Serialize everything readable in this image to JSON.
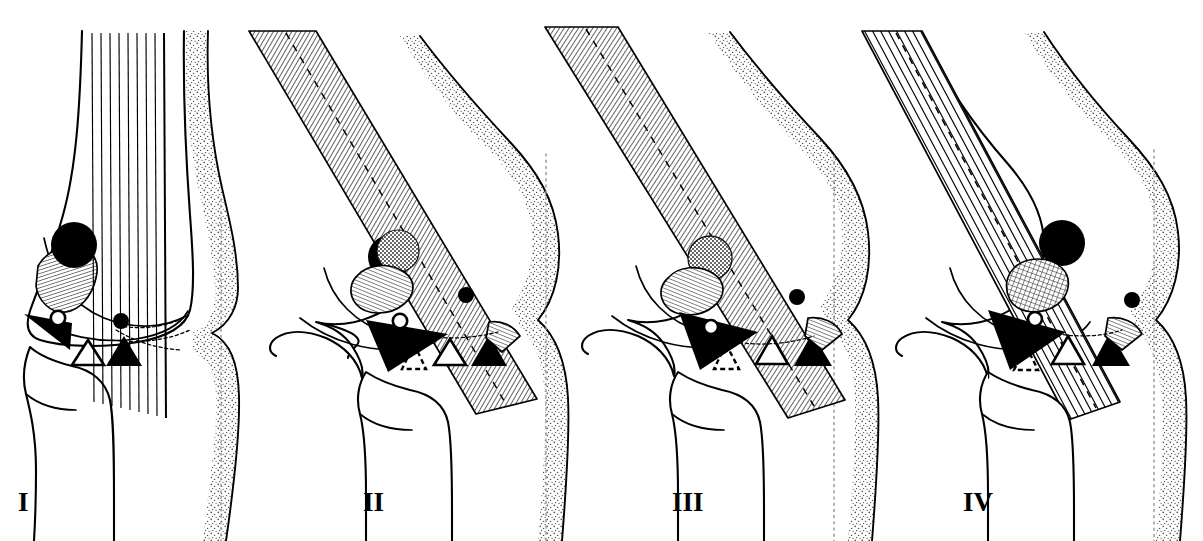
{
  "figure": {
    "background_color": "#ffffff",
    "ink_color": "#000000",
    "reference_line_color": "#9a9a9a",
    "width": 1203,
    "height": 541
  },
  "panels": [
    {
      "id": "panel-1",
      "label": "I",
      "label_x": 18,
      "label_y": 511,
      "state": "full extension",
      "flexion_angle_deg": 0,
      "muscle_band": {
        "style": "parallel-line fascicles, vertical",
        "line_count": 10,
        "angle_deg": 90,
        "has_dashed_axis": false
      },
      "patella_marker": "solid-black-circle",
      "cartilage_marker": "fine-hatch-patch",
      "markers": [
        "solid-left-triangle",
        "open-circle",
        "solid-circle",
        "open-up-triangle",
        "solid-up-triangle"
      ],
      "has_dashed_triangle": false,
      "has_posterior_dot": false,
      "has_tibial-tubercle-hatch": false
    },
    {
      "id": "panel-2",
      "label": "II",
      "label_x": 363,
      "label_y": 511,
      "state": "early flexion",
      "flexion_angle_deg": 30,
      "muscle_band": {
        "style": "dense diagonal hatch band",
        "line_count": 46,
        "angle_deg": 59,
        "has_dashed_axis": true
      },
      "patella_marker": "stipple-circle-over-black",
      "cartilage_marker": "fine-hatch-patch",
      "markers": [
        "solid-left-triangle",
        "open-circle",
        "solid-circle",
        "dashed-open-triangle",
        "open-up-triangle",
        "solid-up-triangle"
      ],
      "has_dashed_triangle": true,
      "has_posterior_dot": true,
      "has_tibial-tubercle-hatch": true
    },
    {
      "id": "panel-3",
      "label": "III",
      "label_x": 672,
      "label_y": 511,
      "state": "mid flexion",
      "flexion_angle_deg": 60,
      "muscle_band": {
        "style": "dense diagonal hatch band",
        "line_count": 46,
        "angle_deg": 56,
        "has_dashed_axis": true
      },
      "patella_marker": "stipple-circle",
      "cartilage_marker": "fine-hatch-patch",
      "markers": [
        "solid-left-triangle",
        "open-circle",
        "solid-circle",
        "dashed-open-triangle",
        "open-up-triangle",
        "solid-up-triangle"
      ],
      "has_dashed_triangle": true,
      "has_posterior_dot": true,
      "has_tibial-tubercle-hatch": true
    },
    {
      "id": "panel-4",
      "label": "IV",
      "label_x": 963,
      "label_y": 511,
      "state": "deep flexion",
      "flexion_angle_deg": 90,
      "muscle_band": {
        "style": "wide-spaced diagonal fascicle lines",
        "line_count": 14,
        "angle_deg": 52,
        "has_dashed_axis": true
      },
      "patella_marker": "solid-black-circle",
      "cartilage_marker": "cross-hatch-patch",
      "markers": [
        "solid-left-triangle",
        "open-circle",
        "solid-circle",
        "dashed-open-triangle",
        "open-up-triangle",
        "solid-up-triangle"
      ],
      "has_dashed_triangle": true,
      "has_posterior_dot": true,
      "has_tibial-tubercle-hatch": true
    }
  ],
  "legend_symbols": [
    {
      "name": "solid-left-triangle",
      "meaning": "infrapatellar fat pad / Hoffa"
    },
    {
      "name": "open-circle",
      "meaning": "inferior patellar pole"
    },
    {
      "name": "solid-circle",
      "meaning": "patellar tendon insertion point"
    },
    {
      "name": "open-up-triangle",
      "meaning": "anterior joint line landmark"
    },
    {
      "name": "solid-up-triangle",
      "meaning": "tibial tuberosity"
    },
    {
      "name": "dashed-open-triangle",
      "meaning": "projected landmark position"
    }
  ]
}
